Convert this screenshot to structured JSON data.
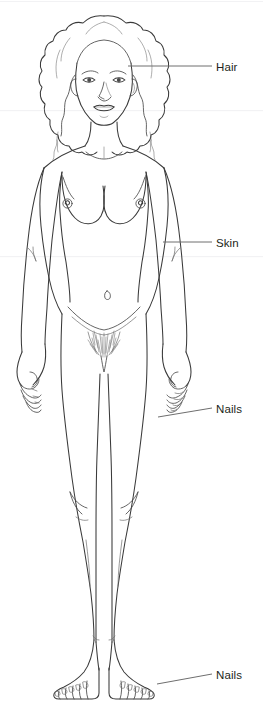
{
  "figure": {
    "background_color": "#ffffff",
    "line_color": "#3a3a3a",
    "text_color": "#231f20",
    "width_px": 263,
    "height_px": 705
  },
  "labels": [
    {
      "id": "hair",
      "text": "Hair",
      "text_x": 216,
      "text_y": 62,
      "leader": {
        "x1": 128,
        "y1": 66,
        "x2": 212,
        "y2": 66
      },
      "target": "hair on side of head"
    },
    {
      "id": "skin",
      "text": "Skin",
      "text_x": 216,
      "text_y": 238,
      "leader": {
        "x1": 163,
        "y1": 242,
        "x2": 212,
        "y2": 242
      },
      "target": "upper arm skin surface"
    },
    {
      "id": "nails-hand",
      "text": "Nails",
      "text_x": 216,
      "text_y": 404,
      "leader": {
        "x1": 158,
        "y1": 417,
        "x2": 212,
        "y2": 408
      },
      "target": "fingernails of right hand"
    },
    {
      "id": "nails-foot",
      "text": "Nails",
      "text_x": 216,
      "text_y": 670,
      "leader": {
        "x1": 157,
        "y1": 684,
        "x2": 212,
        "y2": 674
      },
      "target": "toenails of right foot"
    }
  ],
  "colors": {
    "outline": "#3a3a3a",
    "outline_light": "#6b6b6b",
    "leader": "#6e6e6e",
    "text": "#231f20",
    "background": "#ffffff",
    "band": "#f2f2f4"
  },
  "body_parts": [
    "hair",
    "face",
    "eyes",
    "nose",
    "lips",
    "neck",
    "shoulders",
    "breasts",
    "navel",
    "arms",
    "hands",
    "fingernails",
    "pubic hair",
    "thighs",
    "knees",
    "lower legs",
    "feet",
    "toenails"
  ]
}
